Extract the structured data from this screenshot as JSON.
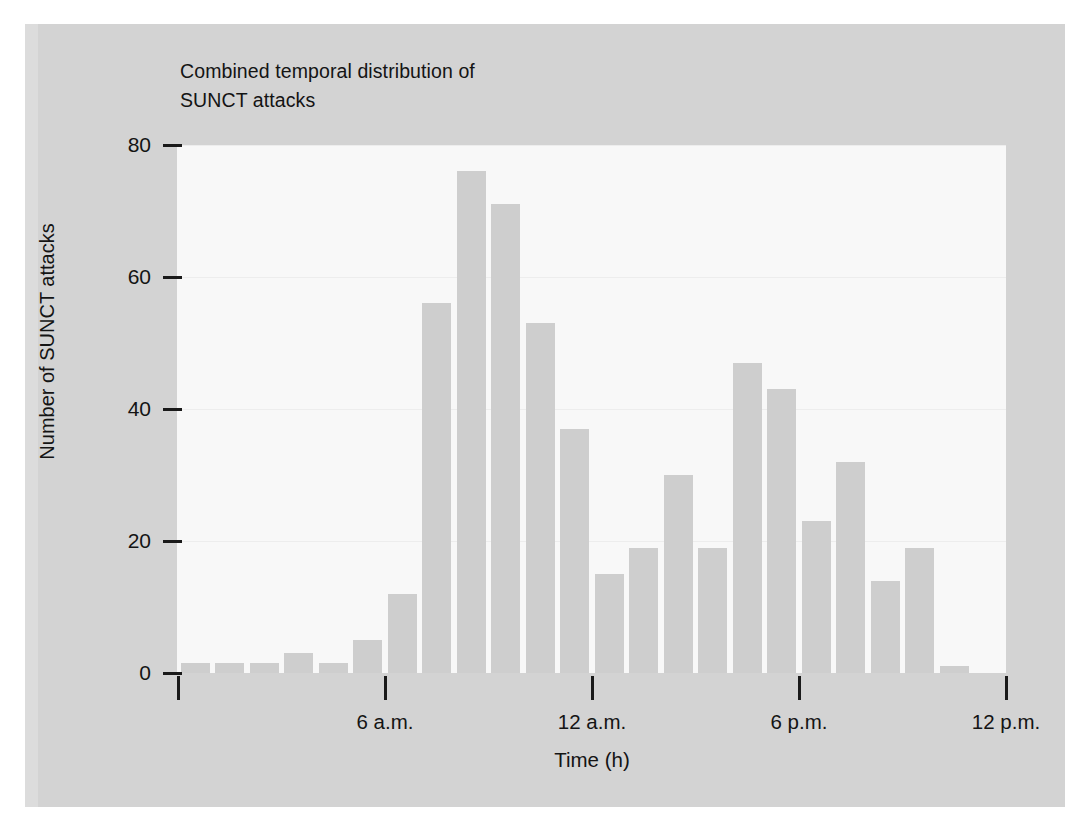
{
  "figure": {
    "title": "Combined temporal distribution of\nSUNCT attacks",
    "background_color": "#d3d3d3",
    "plot_background_color": "#f8f8f8",
    "bar_color": "#cecece",
    "text_color": "#141414"
  },
  "chart_data": {
    "type": "bar",
    "title": "Combined temporal distribution of SUNCT attacks",
    "xlabel": "Time (h)",
    "ylabel": "Number of SUNCT attacks",
    "ylim": [
      0,
      80
    ],
    "xlim": [
      0,
      24
    ],
    "grid": true,
    "legend": null,
    "yticks": [
      0,
      20,
      40,
      60,
      80
    ],
    "ytick_labels": [
      "0",
      "20",
      "40",
      "60",
      "80"
    ],
    "xticks": [
      0,
      6,
      12,
      18,
      24
    ],
    "xtick_labels": [
      "",
      "6 a.m.",
      "12 a.m.",
      "6 p.m.",
      "12 p.m."
    ],
    "categories": [
      "0-1",
      "1-2",
      "2-3",
      "3-4",
      "4-5",
      "5-6",
      "6-7",
      "7-8",
      "8-9",
      "9-10",
      "10-11",
      "11-12",
      "12-13",
      "13-14",
      "14-15",
      "15-16",
      "16-17",
      "17-18",
      "18-19",
      "19-20",
      "20-21",
      "21-22",
      "22-23",
      "23-24"
    ],
    "values": [
      1.5,
      1.5,
      1.5,
      3,
      1.5,
      5,
      12,
      56,
      76,
      71,
      53,
      37,
      15,
      19,
      30,
      19,
      47,
      43,
      23,
      32,
      14,
      19,
      1,
      0
    ],
    "bar_count": 24
  },
  "axes": {
    "y_ticks": [
      {
        "label": "80",
        "value": 80
      },
      {
        "label": "60",
        "value": 60
      },
      {
        "label": "40",
        "value": 40
      },
      {
        "label": "20",
        "value": 20
      },
      {
        "label": "0",
        "value": 0
      }
    ],
    "x_ticks": [
      {
        "label": "",
        "value": 0
      },
      {
        "label": "6 a.m.",
        "value": 6
      },
      {
        "label": "12 a.m.",
        "value": 12
      },
      {
        "label": "6 p.m.",
        "value": 18
      },
      {
        "label": "12 p.m.",
        "value": 24
      }
    ],
    "x_title": "Time (h)",
    "y_title": "Number of SUNCT attacks"
  }
}
